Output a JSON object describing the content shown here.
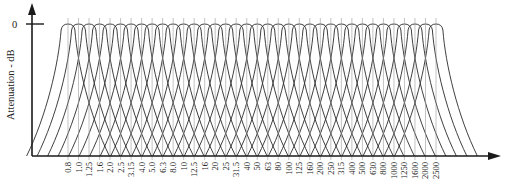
{
  "chart_data": {
    "type": "line",
    "title": "",
    "xlabel": "",
    "ylabel": "Attenuation - dB",
    "y_ticks": [
      "0"
    ],
    "categories": [
      "0.8",
      "1.0",
      "1.25",
      "1.6",
      "2.0",
      "2.5",
      "3.15",
      "4.0",
      "5.0",
      "6.3",
      "8.0",
      "10",
      "12.5",
      "16",
      "20",
      "25",
      "31.5",
      "40",
      "50",
      "63",
      "80",
      "100",
      "125",
      "160",
      "200",
      "250",
      "315",
      "400",
      "500",
      "630",
      "800",
      "1000",
      "1250",
      "1600",
      "2000",
      "2500"
    ],
    "peak_attenuation_db": 0,
    "grid": false,
    "legend": "none"
  },
  "axes": {
    "y_label": "Attenuation - dB",
    "zero_label": "0"
  },
  "style": {
    "line_color": "#2a2a2a",
    "tick_color": "#9a9a9a",
    "background": "#ffffff"
  }
}
